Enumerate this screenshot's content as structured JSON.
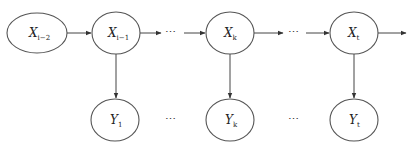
{
  "diagram": {
    "type": "hidden-markov-model",
    "hidden_states": [
      {
        "id": "x_i_minus_2",
        "label": "X",
        "subscript": "i−2",
        "cx": 37,
        "cy": 33,
        "rx": 30,
        "ry": 20
      },
      {
        "id": "x_i_minus_1",
        "label": "X",
        "subscript": "i−1",
        "cx": 116,
        "cy": 33,
        "rx": 24,
        "ry": 21
      },
      {
        "id": "x_k",
        "label": "X",
        "subscript": "k",
        "cx": 230,
        "cy": 33,
        "rx": 24,
        "ry": 21
      },
      {
        "id": "x_t",
        "label": "X",
        "subscript": "t",
        "cx": 354,
        "cy": 33,
        "rx": 24,
        "ry": 21
      }
    ],
    "observations": [
      {
        "id": "y_1",
        "label": "Y",
        "subscript": "1",
        "cx": 115,
        "cy": 120,
        "rx": 24,
        "ry": 21
      },
      {
        "id": "y_k",
        "label": "Y",
        "subscript": "k",
        "cx": 230,
        "cy": 120,
        "rx": 24,
        "ry": 21
      },
      {
        "id": "y_t",
        "label": "Y",
        "subscript": "t",
        "cx": 354,
        "cy": 120,
        "rx": 24,
        "ry": 21
      }
    ],
    "ellipsis": "⋯",
    "ellipsis_positions": [
      {
        "x": 170,
        "y": 36
      },
      {
        "x": 293,
        "y": 36
      },
      {
        "x": 170,
        "y": 123
      },
      {
        "x": 293,
        "y": 123
      }
    ],
    "edges": [
      {
        "from": "x_i_minus_2",
        "to": "x_i_minus_1",
        "kind": "arrow"
      },
      {
        "from": "x_i_minus_1",
        "to": "ellipsis_1",
        "kind": "arrow"
      },
      {
        "from": "ellipsis_1",
        "to": "x_k",
        "kind": "arrow"
      },
      {
        "from": "x_k",
        "to": "ellipsis_2",
        "kind": "arrow"
      },
      {
        "from": "ellipsis_2",
        "to": "x_t",
        "kind": "arrow"
      },
      {
        "from": "x_t",
        "to": "offscreen",
        "kind": "arrow"
      },
      {
        "from": "x_i_minus_1",
        "to": "y_1",
        "kind": "arrow"
      },
      {
        "from": "x_k",
        "to": "y_k",
        "kind": "arrow"
      },
      {
        "from": "x_t",
        "to": "y_t",
        "kind": "arrow"
      }
    ],
    "colors": {
      "stroke": "#555555",
      "edge": "#444444",
      "text": "#222222",
      "background": "#ffffff"
    }
  }
}
